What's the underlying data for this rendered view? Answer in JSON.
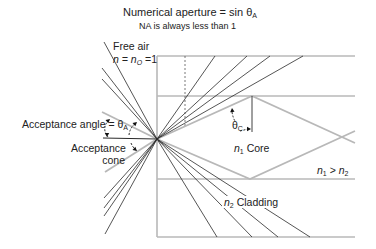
{
  "title": {
    "main": "Numerical aperture = sin θ",
    "main_sub": "A",
    "note": "NA is always less than 1"
  },
  "labels": {
    "free_air": "Free air",
    "n_eq": "n = n",
    "n_eq_sub": "O",
    "n_eq_val": " =1",
    "acceptance_angle": "Acceptance angle = θ",
    "acceptance_angle_sub": "A",
    "acceptance_cone_1": "Acceptance",
    "acceptance_cone_2": "cone",
    "theta_c": "θ",
    "theta_c_sub": "C",
    "core_n": "n",
    "core_sub": "1",
    "core_word": " Core",
    "relation_n1": "n",
    "relation_n1_sub": "1",
    "relation_gt": " > ",
    "relation_n2": "n",
    "relation_n2_sub": "2",
    "cladding_n": "n",
    "cladding_sub": "2",
    "cladding_word": " Cladding"
  },
  "colors": {
    "fiber_edge": "#b8b8b8",
    "gray_ray": "#b8b8b8",
    "dark_ray": "#2a2a2a",
    "text": "#222222"
  },
  "geometry": {
    "focal": [
      157,
      139
    ],
    "fiber": {
      "left_x": 157,
      "right_x": 355,
      "clad_top_y": 56,
      "core_top_y": 96,
      "core_bottom_y": 179,
      "clad_bottom_y": 237
    },
    "dashed_marker": {
      "x": 185,
      "y1": 56,
      "y2": 128
    },
    "incoming_dark_rays_top": [
      [
        104,
        42
      ],
      [
        102,
        68
      ],
      [
        102,
        79
      ]
    ],
    "incoming_dark_rays_bottom": [
      [
        104,
        198
      ],
      [
        104,
        208
      ],
      [
        104,
        216
      ],
      [
        105,
        234
      ]
    ],
    "incoming_axis_line": [
      103,
      138
    ],
    "acceptance_gray_rays": [
      [
        102,
        112
      ],
      [
        105,
        172
      ]
    ],
    "refracted_rays_top_end_x": [
      215,
      247,
      270,
      303
    ],
    "refracted_rays_bottom": [
      [
        217,
        237
      ],
      [
        252,
        237
      ],
      [
        278,
        237
      ],
      [
        310,
        237
      ]
    ],
    "zigzag_upper": [
      [
        157,
        139
      ],
      [
        252,
        96
      ],
      [
        355,
        143
      ]
    ],
    "zigzag_lower": [
      [
        157,
        139
      ],
      [
        250,
        179
      ],
      [
        355,
        131
      ]
    ],
    "normal_line": {
      "x": 252,
      "y1": 96,
      "y2": 132
    }
  }
}
